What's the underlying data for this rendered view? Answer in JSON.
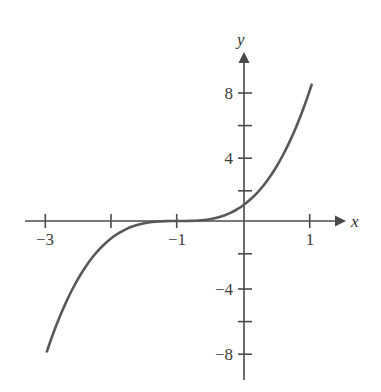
{
  "figure": {
    "width": 381,
    "height": 392,
    "background": "#ffffff"
  },
  "chart_data": {
    "type": "line",
    "title": "",
    "subtitle": "",
    "xlabel": "x",
    "ylabel": "y",
    "equation": "y = (x + 1)^3",
    "grid": false,
    "legend": false,
    "legend_position": "none",
    "axis_style": "cartesian-arrows",
    "xlim": [
      -3.35,
      1.47
    ],
    "ylim": [
      -10.05,
      10.05
    ],
    "xticks": [
      -3,
      -2,
      -1,
      1
    ],
    "xtick_labels": [
      "−3",
      "",
      "−1",
      "1"
    ],
    "yticks": [
      8,
      6,
      4,
      2,
      -2,
      -4,
      -6,
      -8
    ],
    "ytick_labels": [
      "8",
      "",
      "4",
      "",
      "",
      "−4",
      "",
      "−8"
    ],
    "series": [
      {
        "name": "y = (x + 1)^3",
        "color": "#585858",
        "line_width": 2.6,
        "x": [
          -3.0,
          -2.9,
          -2.8,
          -2.7,
          -2.6,
          -2.5,
          -2.4,
          -2.3,
          -2.2,
          -2.1,
          -2.0,
          -1.9,
          -1.8,
          -1.7,
          -1.6,
          -1.5,
          -1.4,
          -1.3,
          -1.2,
          -1.1,
          -1.0,
          -0.9,
          -0.8,
          -0.7,
          -0.6,
          -0.5,
          -0.4,
          -0.3,
          -0.2,
          -0.1,
          0.0,
          0.1,
          0.2,
          0.3,
          0.4,
          0.5,
          0.6,
          0.7,
          0.8,
          0.9,
          1.0,
          1.03
        ],
        "y": [
          -8.0,
          -6.859,
          -5.832,
          -4.913,
          -4.096,
          -3.375,
          -2.744,
          -2.197,
          -1.728,
          -1.331,
          -1.0,
          -0.729,
          -0.512,
          -0.343,
          -0.216,
          -0.125,
          -0.064,
          -0.027,
          -0.008,
          -0.001,
          0.0,
          0.001,
          0.008,
          0.027,
          0.064,
          0.125,
          0.216,
          0.343,
          0.512,
          0.729,
          1.0,
          1.331,
          1.728,
          2.197,
          2.744,
          3.375,
          4.096,
          4.913,
          5.832,
          6.859,
          8.0,
          8.365
        ]
      }
    ],
    "annotations": [
      {
        "text": "inflection point at (−1, 0)",
        "x": -1,
        "y": 0
      }
    ]
  },
  "axes": {
    "color": "#4a4a4a",
    "x_axis_label": "x",
    "y_axis_label": "y",
    "origin_px": {
      "x": 244,
      "y": 221
    },
    "px_per_unit": {
      "x": 65.7,
      "y": 16.3
    }
  },
  "labels": {
    "x_ticks": [
      {
        "text": "−3",
        "x_px": 45,
        "y_px": 231
      },
      {
        "text": "−1",
        "x_px": 177,
        "y_px": 231
      },
      {
        "text": "1",
        "x_px": 310,
        "y_px": 231
      }
    ],
    "y_ticks": [
      {
        "text": "8",
        "x_px": 233,
        "y_px": 93
      },
      {
        "text": "4",
        "x_px": 233,
        "y_px": 158
      },
      {
        "text": "−4",
        "x_px": 233,
        "y_px": 289
      },
      {
        "text": "−8",
        "x_px": 233,
        "y_px": 354
      }
    ],
    "axis_names": [
      {
        "text": "x",
        "x_px": 351,
        "y_px": 213
      },
      {
        "text": "y",
        "x_px": 237,
        "y_px": 31
      }
    ]
  }
}
